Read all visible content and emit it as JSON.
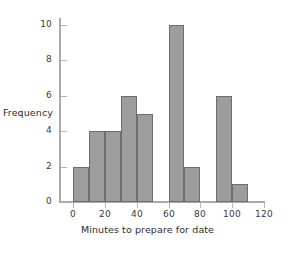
{
  "chart_data": {
    "type": "bar",
    "title": "",
    "subtitle": "",
    "xlabel": "Minutes to prepare for date",
    "ylabel": "Frequency",
    "bin_width": 10,
    "bin_starts": [
      0,
      10,
      20,
      30,
      40,
      50,
      60,
      70,
      80,
      90,
      100
    ],
    "categories": [
      "0-10",
      "10-20",
      "20-30",
      "30-40",
      "40-50",
      "50-60",
      "60-70",
      "70-80",
      "80-90",
      "90-100",
      "100-110"
    ],
    "values": [
      2,
      4,
      4,
      6,
      5,
      0,
      10,
      2,
      0,
      6,
      1
    ],
    "xlim": [
      0,
      120
    ],
    "ylim": [
      0,
      10
    ],
    "xticks": [
      "0",
      "20",
      "40",
      "60",
      "80",
      "100",
      "120"
    ],
    "xtick_values": [
      0,
      20,
      40,
      60,
      80,
      100,
      120
    ],
    "yticks": [
      "0",
      "2",
      "4",
      "6",
      "8",
      "10"
    ],
    "ytick_values": [
      0,
      2,
      4,
      6,
      8,
      10
    ],
    "grid": false,
    "legend": "none",
    "bar_fill_color": "#9d9d9d",
    "bar_edge_color": "#6e6e6e",
    "axis_color": "#a9a9a9",
    "background_color": "#ffffff"
  }
}
